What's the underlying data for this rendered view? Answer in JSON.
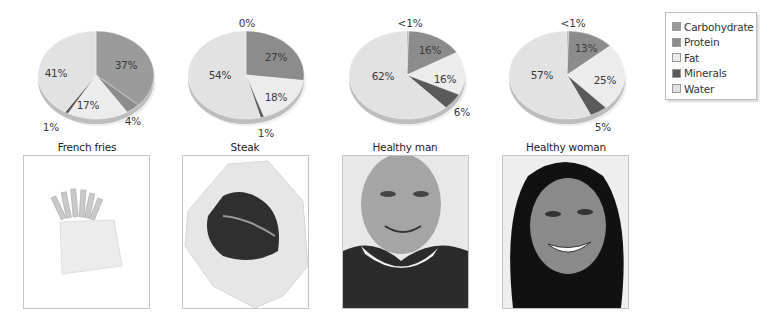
{
  "chart_data": {
    "type": "pie",
    "title": "",
    "categories": [
      "Carbohydrate",
      "Protein",
      "Fat",
      "Minerals",
      "Water"
    ],
    "colors": {
      "Carbohydrate": "#9b9b9b",
      "Protein": "#8c8c8c",
      "Fat": "#ececec",
      "Minerals": "#5a5a5a",
      "Water": "#e2e2e2"
    },
    "legend_position": "top-right",
    "pies": [
      {
        "name": "French fries",
        "slices": [
          {
            "category": "Carbohydrate",
            "value": 37,
            "label": "37%"
          },
          {
            "category": "Protein",
            "value": 4,
            "label": "4%"
          },
          {
            "category": "Fat",
            "value": 17,
            "label": "17%"
          },
          {
            "category": "Minerals",
            "value": 1,
            "label": "1%"
          },
          {
            "category": "Water",
            "value": 41,
            "label": "41%"
          }
        ]
      },
      {
        "name": "Steak",
        "slices": [
          {
            "category": "Carbohydrate",
            "value": 0,
            "label": "0%"
          },
          {
            "category": "Protein",
            "value": 27,
            "label": "27%"
          },
          {
            "category": "Fat",
            "value": 18,
            "label": "18%"
          },
          {
            "category": "Minerals",
            "value": 1,
            "label": "1%"
          },
          {
            "category": "Water",
            "value": 54,
            "label": "54%"
          }
        ]
      },
      {
        "name": "Healthy man",
        "slices": [
          {
            "category": "Carbohydrate",
            "value": 0.5,
            "label": "<1%"
          },
          {
            "category": "Protein",
            "value": 16,
            "label": "16%"
          },
          {
            "category": "Fat",
            "value": 16,
            "label": "16%"
          },
          {
            "category": "Minerals",
            "value": 6,
            "label": "6%"
          },
          {
            "category": "Water",
            "value": 62,
            "label": "62%"
          }
        ]
      },
      {
        "name": "Healthy woman",
        "slices": [
          {
            "category": "Carbohydrate",
            "value": 0.5,
            "label": "<1%"
          },
          {
            "category": "Protein",
            "value": 13,
            "label": "13%"
          },
          {
            "category": "Fat",
            "value": 25,
            "label": "25%"
          },
          {
            "category": "Minerals",
            "value": 5,
            "label": "5%"
          },
          {
            "category": "Water",
            "value": 57,
            "label": "57%"
          }
        ]
      }
    ]
  },
  "legend": {
    "items": [
      "Carbohydrate",
      "Protein",
      "Fat",
      "Minerals",
      "Water"
    ]
  },
  "captions": [
    "French fries",
    "Steak",
    "Healthy man",
    "Healthy woman"
  ],
  "photos": [
    "french-fries-photo",
    "steak-photo",
    "healthy-man-photo",
    "healthy-woman-photo"
  ]
}
